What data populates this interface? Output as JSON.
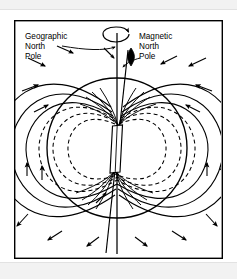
{
  "figure": {
    "title_visible": false,
    "background_color": "#ffffff",
    "ink_color": "#000000",
    "band_color": "#f2f2f2",
    "frame": {
      "name": "figure-border",
      "x": 14,
      "y": 20,
      "width": 208,
      "height": 238,
      "stroke": "#000000",
      "stroke_width": 1.4
    }
  },
  "labels": {
    "geographic": {
      "lines": [
        "Geographic",
        "North",
        "Pole"
      ],
      "line1": "Geographic",
      "line2": "North",
      "line3": "Pole",
      "anchor_x": 25,
      "anchor_y": 36
    },
    "magnetic": {
      "lines": [
        "Magnetic",
        "North",
        "Pole"
      ],
      "line1": "Magnetic",
      "line2": "North",
      "line3": "Pole",
      "anchor_x": 138,
      "anchor_y": 36
    }
  },
  "diagram": {
    "earth": {
      "name": "earth-circle",
      "cx": 117,
      "cy": 148,
      "r": 70,
      "stroke": "#000000",
      "dashed": false
    },
    "rotation_axis": {
      "name": "rotation-axis",
      "x1": 117,
      "y1": 32,
      "x2": 117,
      "y2": 254,
      "tilt_degrees": 0
    },
    "magnetic_axis": {
      "name": "magnetic-axis",
      "x1": 126,
      "y1": 56,
      "x2": 108,
      "y2": 252,
      "tilt_degrees": 11
    },
    "rotation_indicator": {
      "name": "rotation-ellipse",
      "cx": 117,
      "cy": 37,
      "rx": 13,
      "ry": 6,
      "direction": "counterclockwise"
    },
    "magnet_bar": {
      "name": "bar-magnet",
      "cx": 117,
      "top_y": 125,
      "bottom_y": 172,
      "half_width": 5
    },
    "magnetic_pole_marker": {
      "name": "magnetic-pole-diamond",
      "cx": 131,
      "cy": 57,
      "rx": 4,
      "ry": 8,
      "fill": "#000000"
    },
    "field_lines": {
      "solid_count": 6,
      "dashed_count": 4,
      "arrow_count": 18,
      "style_solid": "solid",
      "style_inner": "dashed"
    }
  }
}
